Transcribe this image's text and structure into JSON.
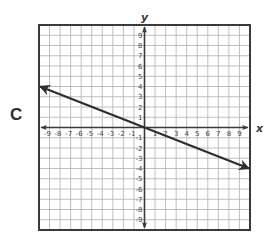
{
  "choice_label": "C",
  "chart_data": {
    "type": "line",
    "title": "",
    "xlabel": "x",
    "ylabel": "y",
    "xlim": [
      -10,
      10
    ],
    "ylim": [
      -10,
      10
    ],
    "grid": true,
    "x_ticks": [
      -9,
      -8,
      -7,
      -6,
      -5,
      -4,
      -3,
      -2,
      -1,
      1,
      2,
      3,
      4,
      5,
      6,
      7,
      8,
      9
    ],
    "y_ticks": [
      -9,
      -8,
      -7,
      -6,
      -5,
      -4,
      -3,
      -2,
      -1,
      1,
      2,
      3,
      4,
      5,
      6,
      7,
      8,
      9
    ],
    "series": [
      {
        "name": "line",
        "description": "line through origin with arrows at both ends",
        "equation": "y = -2/5 x",
        "points": [
          [
            -10,
            4
          ],
          [
            0,
            0
          ],
          [
            10,
            -4
          ]
        ]
      }
    ]
  },
  "colors": {
    "grid": "#b8b8b8",
    "border": "#3a3a3a",
    "axis": "#3a3a3a",
    "line": "#2e2e2e",
    "text": "#444444"
  }
}
